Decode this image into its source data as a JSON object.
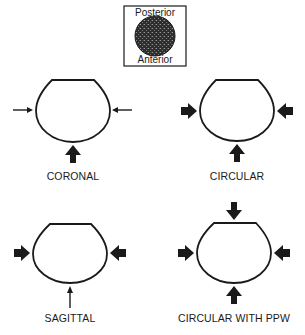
{
  "legend": {
    "top_label": "Posterior",
    "bottom_label": "Anterior",
    "fill_color": "#3a3a3a"
  },
  "panels": [
    {
      "id": "coronal",
      "label": "CORONAL",
      "arrows": {
        "left": "thin",
        "right": "thin",
        "bottom": "thick",
        "top": "none"
      }
    },
    {
      "id": "circular",
      "label": "CIRCULAR",
      "arrows": {
        "left": "thick",
        "right": "thick",
        "bottom": "thick",
        "top": "none"
      }
    },
    {
      "id": "sagittal",
      "label": "SAGITTAL",
      "arrows": {
        "left": "thick",
        "right": "thick",
        "bottom": "thin",
        "top": "none"
      }
    },
    {
      "id": "circular-with-ppw",
      "label": "CIRCULAR WITH PPW",
      "arrows": {
        "left": "thick",
        "right": "thick",
        "bottom": "thick",
        "top": "thick"
      }
    }
  ],
  "colors": {
    "ink": "#1a1a1a",
    "background": "#ffffff"
  }
}
